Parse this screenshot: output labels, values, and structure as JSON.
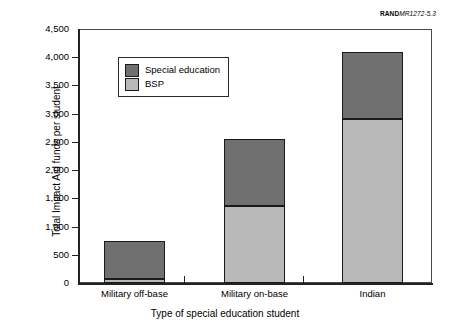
{
  "source_id": {
    "brand": "RAND",
    "code": "MR1272-5.3"
  },
  "chart_data": {
    "type": "bar",
    "subtype": "stacked-vertical",
    "title": "",
    "xlabel": "Type of special education student",
    "ylabel": "Total Impact Aid funds per student",
    "categories": [
      "Military off-base",
      "Military on-base",
      "Indian"
    ],
    "series": [
      {
        "name": "BSP",
        "color": "#b9b9b9",
        "values": [
          70,
          1360,
          2900
        ]
      },
      {
        "name": "Special education",
        "color": "#707070",
        "values": [
          670,
          1200,
          1200
        ]
      }
    ],
    "stack_order": [
      "BSP",
      "Special education"
    ],
    "totals": [
      740,
      2560,
      4100
    ],
    "ylim": [
      0,
      4500
    ],
    "ytick_values": [
      0,
      500,
      1000,
      1500,
      2000,
      2500,
      3000,
      3500,
      4000,
      4500
    ],
    "ytick_labels": [
      "0",
      "500",
      "1,000",
      "1,500",
      "2,000",
      "2,500",
      "3,000",
      "3,500",
      "4,000",
      "4,500"
    ],
    "grid": false,
    "legend_position": "upper-left-inside",
    "legend_entries": [
      "Special education",
      "BSP"
    ]
  },
  "axes": {
    "y_title": "Total Impact Aid funds per student",
    "x_title": "Type of special education student"
  },
  "legend": {
    "items": [
      {
        "label": "Special education",
        "color": "#707070"
      },
      {
        "label": "BSP",
        "color": "#b9b9b9"
      }
    ]
  }
}
